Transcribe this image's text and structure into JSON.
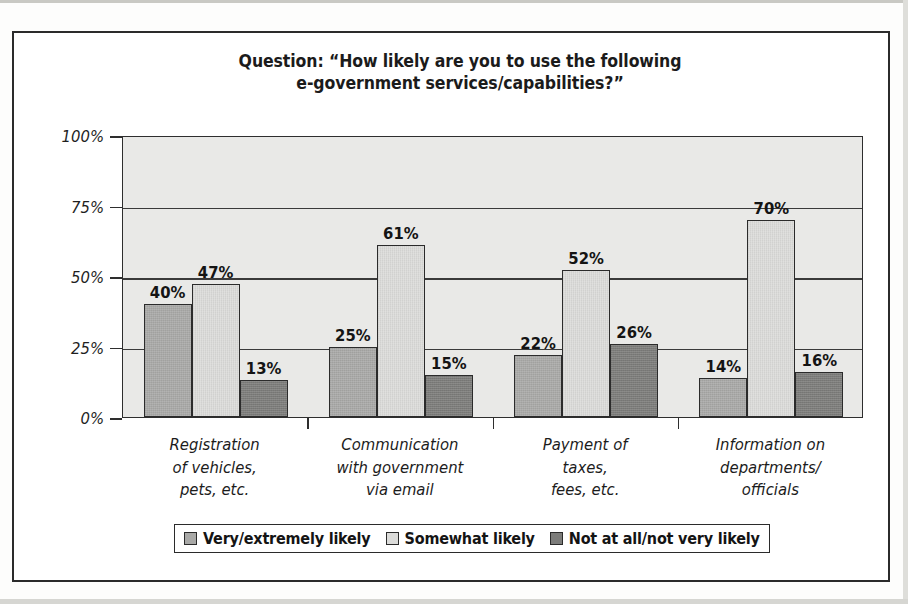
{
  "chart_data": {
    "type": "bar",
    "title": "Question:  “How likely are you to use the following e-government services/capabilities?”",
    "title_lines": [
      "Question:  “How likely are you to use the following",
      "e-government services/capabilities?”"
    ],
    "xlabel": "",
    "ylabel": "",
    "ylim": [
      0,
      100
    ],
    "yticks": [
      0,
      25,
      50,
      75,
      100
    ],
    "ytick_labels": [
      "0%",
      "25%",
      "50%",
      "75%",
      "100%"
    ],
    "grid": true,
    "legend_position": "bottom",
    "categories": [
      "Registration of vehicles, pets, etc.",
      "Communication with government via email",
      "Payment of taxes, fees, etc.",
      "Information on departments/officials"
    ],
    "category_lines": [
      [
        "Registration",
        "of vehicles,",
        "pets, etc."
      ],
      [
        "Communication",
        "with government",
        "via email"
      ],
      [
        "Payment of",
        "taxes,",
        "fees, etc."
      ],
      [
        "Information on",
        "departments/",
        "officials"
      ]
    ],
    "series": [
      {
        "name": "Very/extremely likely",
        "color": "#a9a9a7",
        "values": [
          40,
          25,
          22,
          14
        ],
        "labels": [
          "40%",
          "25%",
          "22%",
          "14%"
        ]
      },
      {
        "name": "Somewhat likely",
        "color": "#dcdcda",
        "values": [
          47,
          61,
          52,
          70
        ],
        "labels": [
          "47%",
          "61%",
          "52%",
          "70%"
        ]
      },
      {
        "name": "Not at all/not very likely",
        "color": "#7c7c7a",
        "values": [
          13,
          15,
          26,
          16
        ],
        "labels": [
          "13%",
          "15%",
          "26%",
          "16%"
        ]
      }
    ],
    "plot_background": "#e9e9e7",
    "frame_color": "#2b2b2b"
  }
}
